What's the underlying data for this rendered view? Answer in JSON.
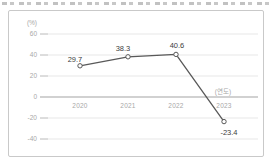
{
  "chart_data": {
    "type": "line",
    "title": "",
    "categories": [
      "2020",
      "2021",
      "2022",
      "2023"
    ],
    "values": [
      29.7,
      38.3,
      40.6,
      -23.4
    ],
    "point_labels": [
      "29.7",
      "38.3",
      "40.6",
      "-23.4"
    ],
    "y_axis_unit_label": "(%)",
    "x_axis_unit_label": "(연도)",
    "yticks": [
      60,
      40,
      20,
      0,
      -20,
      -40
    ],
    "ylim": [
      -40,
      60
    ],
    "grid": true,
    "legend": "none",
    "marker": "open-circle",
    "colors": {
      "line": "#595959",
      "marker_fill": "#ffffff",
      "marker_stroke": "#595959",
      "gridline": "#e7e7e7",
      "tick_stub": "#c6c6c6",
      "zero_line": "#a3a3a3",
      "tick_label": "#a8a8a8",
      "data_label": "#3d3d3d",
      "frame_border": "#c9c9c9"
    }
  }
}
